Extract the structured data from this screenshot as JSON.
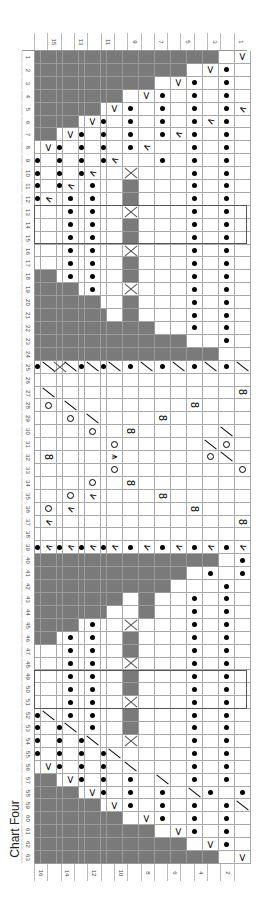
{
  "title": "Chart Four",
  "orientation": "rotated 90° clockwise; chart rows run top to bottom, stitch columns right to left",
  "legend_codes": {
    "g": "no stitch (grey)",
    ".": "knit (blank)",
    "p": "purl (dot)",
    "v": "slip/increase (V)",
    "k": "left-leaning decrease",
    "s": "right-leaning decrease (slash)",
    "o": "yarn over (circle)",
    "8": "twisted stitch (8)",
    "x": "cross (X)",
    "c": "central double decrease"
  },
  "row_numbers": [
    "1",
    "2",
    "3",
    "4",
    "5",
    "6",
    "7",
    "8",
    "9",
    "10",
    "11",
    "12",
    "13",
    "14",
    "15",
    "16",
    "17",
    "18",
    "19",
    "20",
    "21",
    "22",
    "23",
    "24",
    "25",
    "26",
    "27",
    "28",
    "29",
    "30",
    "31",
    "32",
    "33",
    "34",
    "35",
    "36",
    "37",
    "38",
    "39",
    "40",
    "41",
    "42",
    "43",
    "44",
    "45",
    "46",
    "47",
    "48",
    "49",
    "50",
    "51",
    "52",
    "53",
    "54",
    "55",
    "56",
    "57",
    "58",
    "59",
    "60",
    "61",
    "62",
    "63"
  ],
  "col_labels_top": [
    "",
    "15",
    "",
    "13",
    "",
    "11",
    "",
    "9",
    "",
    "7",
    "",
    "5",
    "",
    "3",
    "",
    "1"
  ],
  "col_labels_bottom": [
    "16",
    "",
    "14",
    "",
    "12",
    "",
    "10",
    "",
    "8",
    "",
    "6",
    "",
    "4",
    "",
    "2",
    ""
  ],
  "boxes": [
    {
      "label": "repeat-box-a",
      "row_start": 13,
      "row_end": 15
    },
    {
      "label": "repeat-box-b",
      "row_start": 49,
      "row_end": 51
    }
  ],
  "chart_data": {
    "type": "table",
    "title": "Chart Four",
    "rows": [
      "gggggggggggggg.v",
      "gggggggggggg.vp.",
      "gggggggggg.vp.p.",
      "gggggggg.vp.p.p.",
      "gggggg.vp.p.p.pk",
      "gggg.vp.p.p.pkp.",
      "gg.vp.p.p.pkp.p.",
      ".vp.p.p.pk..p.p.",
      "p.p.p.pk..p.p.p.",
      "p.p.pk..x...p.p.",
      "p.pk.p..g...p.p.",
      "pk.p.p..g...p.p.",
      "...p.p..x...p.p.",
      "...p.p..g...p.p.",
      "...p.p..g...p.p.",
      "...p.p..x...p.p.",
      "...p.p..g...p.p.",
      "gg.p.p..g...p.p.",
      "gggg.p..x...p.p.",
      "gggggg..g...p.p.",
      "ggggggg.g...p.p.",
      "gggggggggg..p.p.",
      "gggggggggggg..p.",
      "gggggggggggggg..",
      "psxspspspspspsps",
      "................",
      ".s.............8",
      ".o.s........8...",
      "...o.s....8.....",
      ".....o..8.....s.",
      ".......o.....so.",
      ".8.....c.....os.",
      ".......o.......o",
      ".....o..8.......",
      "...o.k....8.....",
      ".o.k........8...",
      ".k.............8",
      "................",
      "pkpkpkpkpkpkpkpk",
      "gggggggggggggg.p",
      "gggggggggggg.p.p",
      "ggggggggggg...p.",
      "gggggggg.g..p.p.",
      "ggggggg..g..p.p.",
      "gggg.p..x...p.p.",
      "gg.p.p..g...p.p.",
      "...p.p..g...p.p.",
      "...p.p..x...p.p.",
      "...p.p..g...p.p.",
      "...p.p..g...p.p.",
      "...p.p..x...p.p.",
      "ps.p.p..g...p.p.",
      "p.ps.p..g...p.p.",
      "p.p.ps..x...p.p.",
      "p.p.p.ps....p.p.",
      ".vp.p.p.s...p.p.",
      "gg.vp.p.p.s.p.p.",
      "gggg.vp.p.p.sp.p",
      "gggggg.vp.p.p.ps",
      "gggggggg.vp.p.p.",
      "gggggggggg.vp.p.",
      "gggggggggggg.vp.",
      "gggggggggggggg.v"
    ],
    "xlabel": "stitch",
    "ylabel": "row"
  }
}
